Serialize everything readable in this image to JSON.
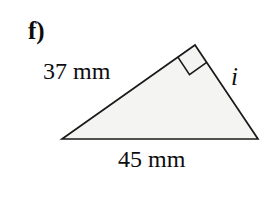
{
  "figure": {
    "part_label": "f)",
    "shape": "right-triangle",
    "fill_color": "#f4f4f2",
    "stroke_color": "#1a1a1a",
    "background_color": "#ffffff",
    "vertices": {
      "left": {
        "x": 62,
        "y": 139
      },
      "apex": {
        "x": 195,
        "y": 45
      },
      "right": {
        "x": 258,
        "y": 139
      }
    },
    "right_angle_marker": {
      "at_vertex": "apex",
      "size": 21,
      "present": true
    },
    "labels": {
      "side_a": "37 mm",
      "side_base": "45 mm",
      "side_unknown": "i"
    }
  }
}
